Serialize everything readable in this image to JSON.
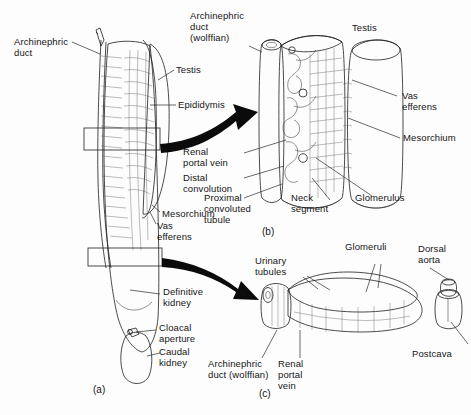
{
  "figure": {
    "background_color": "#fdfdfd",
    "ink_color": "#1a1a1a",
    "arrow_color": "#0b0b0b"
  },
  "panels": [
    {
      "id": "a",
      "caption": "(a)",
      "description": "Whole urogenital organ in ventral view"
    },
    {
      "id": "b",
      "caption": "(b)",
      "description": "Enlarged block of opisthonephric kidney with testis"
    },
    {
      "id": "c",
      "caption": "(c)",
      "description": "Enlarged block of definitive (caudal) kidney"
    }
  ],
  "labels": {
    "panel_a": [
      {
        "name": "archinephric-duct",
        "text": "Archinephric\nduct"
      },
      {
        "name": "testis",
        "text": "Testis"
      },
      {
        "name": "epididymis",
        "text": "Epididymis"
      },
      {
        "name": "mesorchium",
        "text": "Mesorchium"
      },
      {
        "name": "vas-efferens",
        "text": "Vas\nefferens"
      },
      {
        "name": "definitive-kidney",
        "text": "Definitive\nkidney"
      },
      {
        "name": "cloacal-aperture",
        "text": "Cloacal\naperture"
      },
      {
        "name": "caudal-kidney",
        "text": "Caudal\nkidney"
      }
    ],
    "panel_b": [
      {
        "name": "archinephric-duct-wolffian",
        "text": "Archinephric\nduct\n(wolffian)"
      },
      {
        "name": "testis",
        "text": "Testis"
      },
      {
        "name": "vas-efferens",
        "text": "Vas\nefferens"
      },
      {
        "name": "mesorchium",
        "text": "Mesorchium"
      },
      {
        "name": "renal-portal-vein",
        "text": "Renal\nportal vein"
      },
      {
        "name": "distal-convolution",
        "text": "Distal\nconvolution"
      },
      {
        "name": "proximal-convoluted-tubule",
        "text": "Proximal\nconvoluted\ntubule"
      },
      {
        "name": "neck-segment",
        "text": "Neck\nsegment"
      },
      {
        "name": "glomerulus",
        "text": "Glomerulus"
      }
    ],
    "panel_c": [
      {
        "name": "urinary-tubules",
        "text": "Urinary\ntubules"
      },
      {
        "name": "glomeruli",
        "text": "Glomeruli"
      },
      {
        "name": "dorsal-aorta",
        "text": "Dorsal\naorta"
      },
      {
        "name": "postcava",
        "text": "Postcava"
      },
      {
        "name": "archinephric-duct-wolffian",
        "text": "Archinephric\nduct (wolffian)"
      },
      {
        "name": "renal-portal-vein",
        "text": "Renal\nportal\nvein"
      }
    ]
  },
  "text": {
    "archinephric_duct": "Archinephric\nduct",
    "archinephric_duct_wolffian_b": "Archinephric\nduct\n(wolffian)",
    "archinephric_duct_wolffian_c1": "Archinephric",
    "archinephric_duct_wolffian_c2": "duct (wolffian)",
    "testis_a": "Testis",
    "testis_b": "Testis",
    "epididymis": "Epididymis",
    "mesorchium_a": "Mesorchium",
    "mesorchium_b": "Mesorchium",
    "vas_efferens_a": "Vas\nefferens",
    "vas_efferens_b": "Vas\nefferens",
    "definitive_kidney": "Definitive\nkidney",
    "cloacal_aperture": "Cloacal\naperture",
    "caudal_kidney": "Caudal\nkidney",
    "renal_portal_vein_b": "Renal\nportal vein",
    "renal_portal_vein_c": "Renal\nportal\nvein",
    "distal_convolution": "Distal\nconvolution",
    "proximal_convoluted_tubule": "Proximal\nconvoluted\ntubule",
    "neck_segment": "Neck\nsegment",
    "glomerulus": "Glomerulus",
    "glomeruli": "Glomeruli",
    "urinary_tubules": "Urinary\ntubules",
    "dorsal_aorta": "Dorsal\naorta",
    "postcava": "Postcava",
    "caption_a": "(a)",
    "caption_b": "(b)",
    "caption_c": "(c)"
  }
}
